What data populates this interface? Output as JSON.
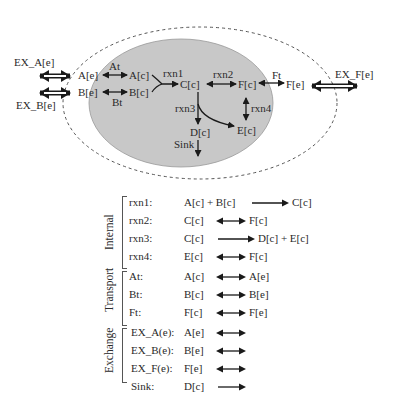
{
  "diagram": {
    "cell_labels": {
      "A_c": "A[c]",
      "B_c": "B[c]",
      "C_c": "C[c]",
      "D_c": "D[c]",
      "E_c": "E[c]",
      "F_c": "F[c]"
    },
    "ext_labels": {
      "A_e": "A[e]",
      "B_e": "B[e]",
      "F_e": "F[e]"
    },
    "exchange_labels": {
      "EX_A": "EX_A[e]",
      "EX_B": "EX_B[e]",
      "EX_F": "EX_F[e]"
    },
    "reaction_labels": {
      "At": "At",
      "Bt": "Bt",
      "Ft": "Ft",
      "rxn1": "rxn1",
      "rxn2": "rxn2",
      "rxn3": "rxn3",
      "rxn4": "rxn4",
      "Sink": "Sink"
    },
    "colors": {
      "cell_fill": "#c8c8c8",
      "arrow": "#1a1a1a",
      "dashed": "#555555"
    }
  },
  "legend": {
    "categories": {
      "internal": "Internal",
      "transport": "Transport",
      "exchange": "Exchange"
    },
    "rows": [
      {
        "name": "rxn1:",
        "lhs": "A[c] + B[c]",
        "arrow": "forward",
        "rhs": "C[c]"
      },
      {
        "name": "rxn2:",
        "lhs": "C[c]",
        "arrow": "reversible",
        "rhs": "F[c]"
      },
      {
        "name": "rxn3:",
        "lhs": "C[c]",
        "arrow": "forward",
        "rhs": "D[c] + E[c]"
      },
      {
        "name": "rxn4:",
        "lhs": "E[c]",
        "arrow": "reversible",
        "rhs": "F[c]"
      },
      {
        "name": "At:",
        "lhs": "A[c]",
        "arrow": "reversible",
        "rhs": "A[e]"
      },
      {
        "name": "Bt:",
        "lhs": "B[c]",
        "arrow": "reversible",
        "rhs": "B[e]"
      },
      {
        "name": "Ft:",
        "lhs": "F[c]",
        "arrow": "reversible",
        "rhs": "F[e]"
      },
      {
        "name": "EX_A(e):",
        "lhs": "A[e]",
        "arrow": "reversible",
        "rhs": ""
      },
      {
        "name": "EX_B(e):",
        "lhs": "B[e]",
        "arrow": "reversible",
        "rhs": ""
      },
      {
        "name": "EX_F(e):",
        "lhs": "F[e]",
        "arrow": "reversible",
        "rhs": ""
      },
      {
        "name": "Sink:",
        "lhs": "D[c]",
        "arrow": "forward",
        "rhs": ""
      }
    ]
  }
}
